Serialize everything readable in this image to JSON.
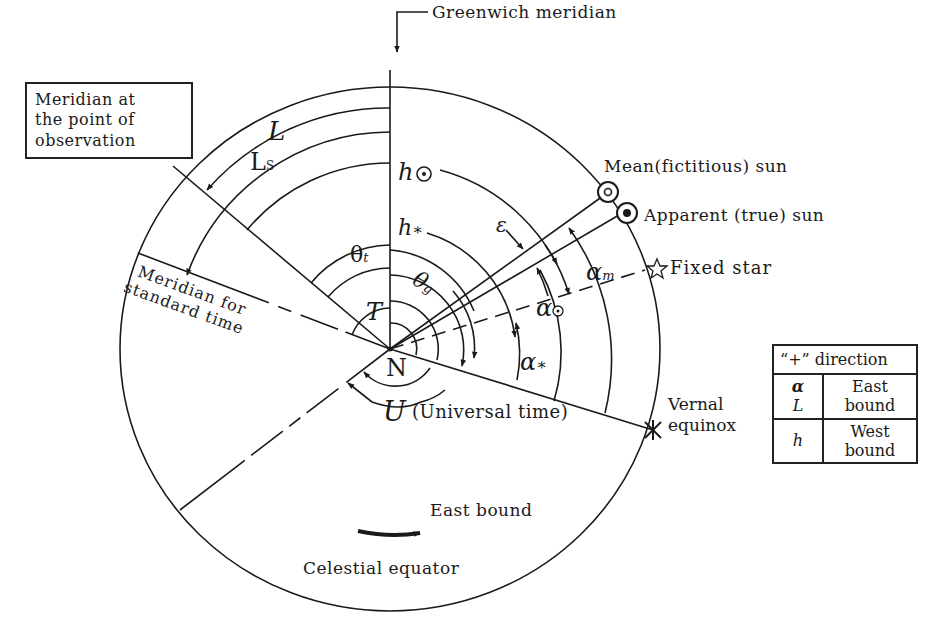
{
  "figure": {
    "greenwich_label": "Greenwich meridian",
    "observer_meridian_label": [
      "Meridian at",
      "the point of",
      "observation"
    ],
    "standard_meridian_label": [
      "Meridian for",
      "standard time"
    ],
    "mean_sun_label": "Mean(fictitious) sun",
    "apparent_sun_label": "Apparent (true) sun",
    "fixed_star_label": "Fixed star",
    "vernal_equinox_label": [
      "Vernal",
      "equinox"
    ],
    "universal_time_label": "(Universal time)",
    "east_bound_label": "East bound",
    "celestial_equator_label": "Celestial equator",
    "center_label": "N",
    "symbols": {
      "L": "L",
      "Ls": "L",
      "Ls_sub": "S",
      "h_sun": "h",
      "h_star": "h",
      "h_star_sub": "∗",
      "theta_t": "θ",
      "theta_t_sub": "t",
      "theta_g": "θ",
      "theta_g_sub": "g",
      "T": "T",
      "U": "U",
      "epsilon": "ε",
      "alpha_m": "α",
      "alpha_m_sub": "m",
      "alpha_sun": "α",
      "alpha_star": "α",
      "alpha_star_sub": "∗"
    }
  },
  "legend": {
    "header": "“+” direction",
    "rows": [
      {
        "symbols": [
          "α",
          "L"
        ],
        "direction": [
          "East",
          "bound"
        ]
      },
      {
        "symbols": [
          "h"
        ],
        "direction": [
          "West",
          "bound"
        ]
      }
    ]
  }
}
